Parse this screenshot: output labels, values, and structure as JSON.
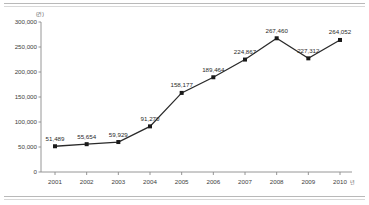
{
  "chart_data": {
    "type": "line",
    "title": "",
    "subtitle": "",
    "xlabel": "",
    "ylabel": "",
    "unit_y": "(건)",
    "unit_x": "년",
    "categories": [
      "2001",
      "2002",
      "2003",
      "2004",
      "2005",
      "2006",
      "2007",
      "2008",
      "2009",
      "2010"
    ],
    "values": [
      51489,
      55654,
      59929,
      91270,
      158177,
      189464,
      224867,
      267460,
      227312,
      264052
    ],
    "point_labels": [
      "51,489",
      "55,654",
      "59,929",
      "91,270",
      "158,177",
      "189,464",
      "224,867",
      "267,460",
      "227,312",
      "264,052"
    ],
    "ylim": [
      0,
      300000
    ],
    "ytick_values": [
      0,
      50000,
      100000,
      150000,
      200000,
      250000,
      300000
    ],
    "ytick_labels": [
      "0",
      "50,000",
      "100,000",
      "150,000",
      "200,000",
      "250,000",
      "300,000"
    ],
    "grid": false,
    "legend": null,
    "series_color": "#2a2a2a",
    "marker": "square"
  }
}
